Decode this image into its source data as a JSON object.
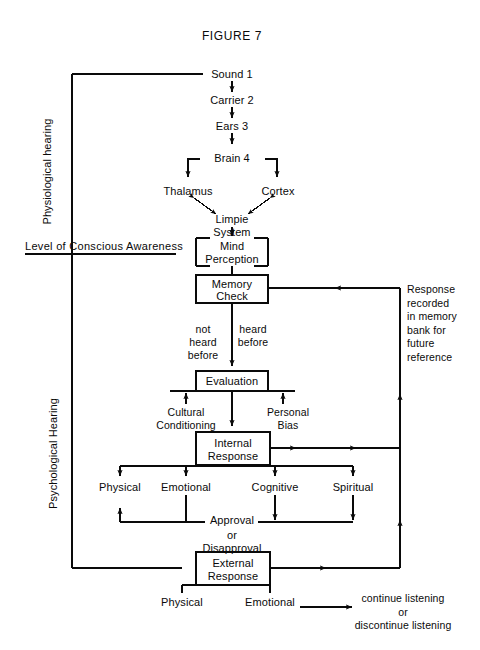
{
  "figure": {
    "title": "FIGURE 7"
  },
  "axis_labels": {
    "physiological": "Physiological hearing",
    "psychological": "Psychological Hearing",
    "consciousness_divider": "Level of Conscious Awareness"
  },
  "nodes": {
    "sound": "Sound 1",
    "carrier": "Carrier 2",
    "ears": "Ears 3",
    "brain": "Brain 4",
    "thalamus": "Thalamus",
    "cortex": "Cortex",
    "limpie_line1": "Limpie",
    "limpie_line2": "System",
    "mind_line1": "Mind",
    "mind_line2": "Perception",
    "memory_line1": "Memory",
    "memory_line2": "Check",
    "evaluation": "Evaluation",
    "internal_line1": "Internal",
    "internal_line2": "Response",
    "external_line1": "External",
    "external_line2": "Response"
  },
  "branch_labels": {
    "not_heard_before": "not\nheard\nbefore",
    "heard_before": "heard\nbefore",
    "cultural_conditioning": "Cultural\nConditioning",
    "personal_bias": "Personal\nBias",
    "internal_physical": "Physical",
    "internal_emotional": "Emotional",
    "internal_cognitive": "Cognitive",
    "internal_spiritual": "Spiritual",
    "approval_line1": "Approval",
    "approval_line2": "or",
    "approval_line3": "Disapproval",
    "external_physical": "Physical",
    "external_emotional": "Emotional"
  },
  "annotations": {
    "memory_feedback": "Response\nrecorded\nin memory\nbank for\nfuture\nreference",
    "outcome": "continue listening\nor\ndiscontinue listening"
  },
  "colors": {
    "ink": "#0a0a0a",
    "background": "#ffffff"
  }
}
